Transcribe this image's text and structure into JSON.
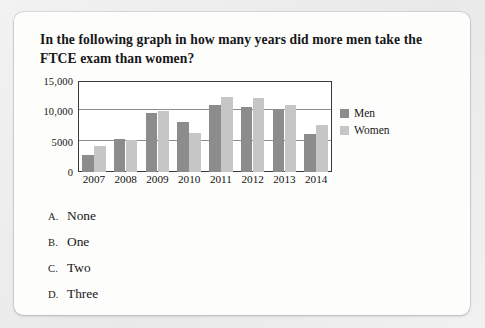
{
  "question": {
    "text": "In the following graph in how many years did more men take the FTCE exam than women?"
  },
  "chart_data": {
    "type": "bar",
    "title": "",
    "xlabel": "",
    "ylabel": "",
    "categories": [
      "2007",
      "2008",
      "2009",
      "2010",
      "2011",
      "2012",
      "2013",
      "2014"
    ],
    "series": [
      {
        "name": "Men",
        "color": "#8c8c8c",
        "values": [
          2800,
          5500,
          9700,
          8300,
          11000,
          10700,
          10200,
          6300
        ]
      },
      {
        "name": "Women",
        "color": "#c6c6c6",
        "values": [
          4300,
          5200,
          10100,
          6400,
          12400,
          12200,
          11000,
          7700
        ]
      }
    ],
    "ylim": [
      0,
      15000
    ],
    "ytick_values": [
      0,
      5000,
      10000,
      15000
    ],
    "ytick_labels": [
      "0",
      "5000",
      "10,000",
      "15,000"
    ],
    "grid": true,
    "legend_position": "right"
  },
  "options": [
    {
      "letter": "A.",
      "label": "None"
    },
    {
      "letter": "B.",
      "label": "One"
    },
    {
      "letter": "C.",
      "label": "Two"
    },
    {
      "letter": "D.",
      "label": "Three"
    }
  ]
}
